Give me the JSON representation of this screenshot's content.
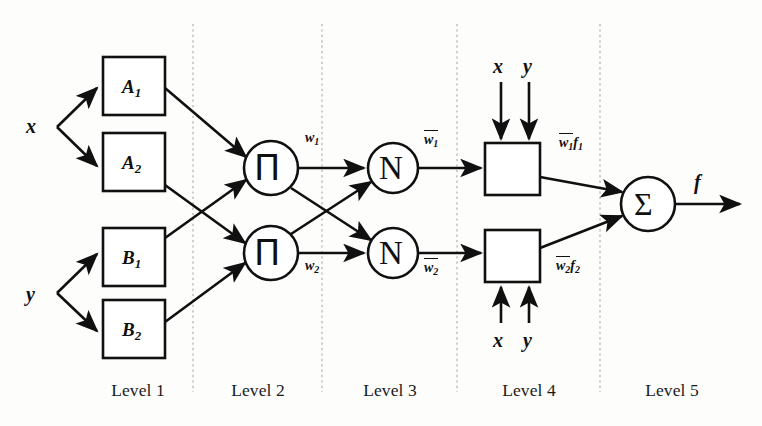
{
  "figure": {
    "background_color": "#fdfdfc",
    "ink_color": "#101010",
    "divider_color": "#b9b9b9"
  },
  "inputs": [
    {
      "name": "input-x",
      "label": "x",
      "x": 32,
      "y": 127
    },
    {
      "name": "input-y",
      "label": "y",
      "x": 32,
      "y": 295
    }
  ],
  "level1": {
    "label": "Level 1",
    "nodes": [
      {
        "name": "membership-node-a1",
        "base": "A",
        "sub": "1",
        "x": 103,
        "y": 57,
        "w": 62,
        "h": 58
      },
      {
        "name": "membership-node-a2",
        "base": "A",
        "sub": "2",
        "x": 103,
        "y": 133,
        "w": 62,
        "h": 58
      },
      {
        "name": "membership-node-b1",
        "base": "B",
        "sub": "1",
        "x": 103,
        "y": 228,
        "w": 62,
        "h": 58
      },
      {
        "name": "membership-node-b2",
        "base": "B",
        "sub": "2",
        "x": 103,
        "y": 300,
        "w": 62,
        "h": 58
      }
    ]
  },
  "level2": {
    "label": "Level 2",
    "nodes": [
      {
        "name": "product-node-1",
        "symbol": "Π",
        "cx": 271,
        "cy": 168,
        "r": 27
      },
      {
        "name": "product-node-2",
        "symbol": "Π",
        "cx": 271,
        "cy": 253,
        "r": 27
      }
    ],
    "outputs": [
      {
        "name": "weight-label-w1",
        "base": "w",
        "sub": "1",
        "x": 309,
        "y": 140
      },
      {
        "name": "weight-label-w2",
        "base": "w",
        "sub": "2",
        "x": 309,
        "y": 266
      }
    ]
  },
  "level3": {
    "label": "Level 3",
    "nodes": [
      {
        "name": "normalization-node-1",
        "symbol": "N",
        "cx": 393,
        "cy": 168,
        "r": 25
      },
      {
        "name": "normalization-node-2",
        "symbol": "N",
        "cx": 393,
        "cy": 253,
        "r": 25
      }
    ],
    "outputs": [
      {
        "name": "normalized-weight-label-w1",
        "base": "w",
        "sub": "1",
        "x": 428,
        "y": 141
      },
      {
        "name": "normalized-weight-label-w2",
        "base": "w",
        "sub": "2",
        "x": 428,
        "y": 268
      }
    ]
  },
  "level4": {
    "label": "Level 4",
    "nodes": [
      {
        "name": "consequent-node-1",
        "x": 485,
        "y": 143,
        "w": 55,
        "h": 52
      },
      {
        "name": "consequent-node-2",
        "x": 485,
        "y": 230,
        "w": 55,
        "h": 52
      }
    ],
    "top_inputs": [
      {
        "name": "consequent-1-input-x",
        "label": "x",
        "x": 493,
        "y": 66
      },
      {
        "name": "consequent-1-input-y",
        "label": "y",
        "x": 525,
        "y": 66
      }
    ],
    "bottom_inputs": [
      {
        "name": "consequent-2-input-x",
        "label": "x",
        "x": 493,
        "y": 330
      },
      {
        "name": "consequent-2-input-y",
        "label": "y",
        "x": 525,
        "y": 330
      }
    ],
    "outputs": [
      {
        "name": "weighted-output-label-1",
        "base": "w",
        "sub": "1",
        "tail": "f",
        "tailsub": "1",
        "x": 563,
        "y": 143
      },
      {
        "name": "weighted-output-label-2",
        "base": "w",
        "sub": "2",
        "tail": "f",
        "tailsub": "2",
        "x": 560,
        "y": 266
      }
    ]
  },
  "level5": {
    "label": "Level 5",
    "node": {
      "name": "summation-node",
      "symbol": "Σ",
      "cx": 648,
      "cy": 204,
      "r": 27
    },
    "output": {
      "name": "output-label-f",
      "label": "f",
      "x": 695,
      "y": 180
    }
  },
  "dividers": [
    {
      "name": "divider-level1-level2",
      "x": 193
    },
    {
      "name": "divider-level2-level3",
      "x": 322
    },
    {
      "name": "divider-level3-level4",
      "x": 457
    },
    {
      "name": "divider-level4-level5",
      "x": 600
    }
  ],
  "level_labels": [
    {
      "name": "level-label-1",
      "text": "Level 1",
      "cx": 138
    },
    {
      "name": "level-label-2",
      "text": "Level 2",
      "cx": 258
    },
    {
      "name": "level-label-3",
      "text": "Level 3",
      "cx": 390
    },
    {
      "name": "level-label-4",
      "text": "Level 4",
      "cx": 529
    },
    {
      "name": "level-label-5",
      "text": "Level 5",
      "cx": 672
    }
  ]
}
